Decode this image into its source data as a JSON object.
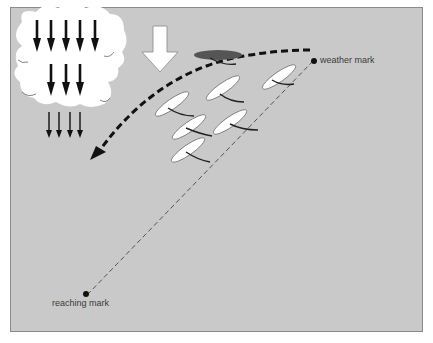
{
  "diagram": {
    "labels": {
      "weather_mark": "weather mark",
      "reaching_mark": "reaching mark"
    },
    "colors": {
      "background": "#c9c9c9",
      "frame": "#8a8a8a",
      "sail": "#ffffff",
      "highlight_boat": "#555555",
      "arrows": "#111111"
    },
    "elements": {
      "cloud_icon": "storm-cloud-with-downdraft-arrows",
      "wind_arrow": "hollow-down-arrow",
      "course_curve": "dashed-curved-arrow",
      "rhumb_line": "dashed-straight-line",
      "boats": 7
    }
  }
}
